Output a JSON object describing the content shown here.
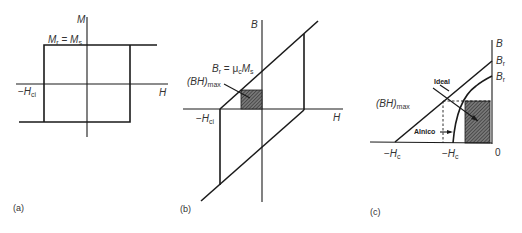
{
  "panels": {
    "a": {
      "caption": "(a)",
      "y_axis": "M",
      "x_axis": "H",
      "remanence_label": {
        "main1": "M",
        "sub1": "r",
        "eq": " = ",
        "main2": "M",
        "sub2": "s"
      },
      "coercivity_label": {
        "prefix": "−",
        "main": "H",
        "sub": "ci"
      }
    },
    "b": {
      "caption": "(b)",
      "y_axis": "B",
      "x_axis": "H",
      "remanence_label": {
        "main1": "B",
        "sub1": "r",
        "eq": " = μ",
        "sub_mu": "c",
        "main2": "M",
        "sub2": "s"
      },
      "bhmax_label": {
        "main": "(BH)",
        "sub": "max"
      },
      "coercivity_label": {
        "prefix": "−",
        "main": "H",
        "sub": "ci"
      }
    },
    "c": {
      "caption": "(c)",
      "y_axis": "B",
      "origin_label": "0",
      "br_ideal": {
        "main": "B",
        "sub": "r"
      },
      "br_alnico": {
        "main": "B",
        "sub": "r"
      },
      "ideal_label": "Ideal",
      "alnico_label": "Alnico",
      "bhmax_label": {
        "main": "(BH)",
        "sub": "max"
      },
      "hc_ideal": {
        "prefix": "−",
        "main": "H",
        "sub": "c"
      },
      "hc_alnico": {
        "prefix": "−",
        "main": "H",
        "sub": "c"
      }
    }
  },
  "colors": {
    "line": "#1a1a1a",
    "hatch": "#555555",
    "text": "#333333"
  }
}
